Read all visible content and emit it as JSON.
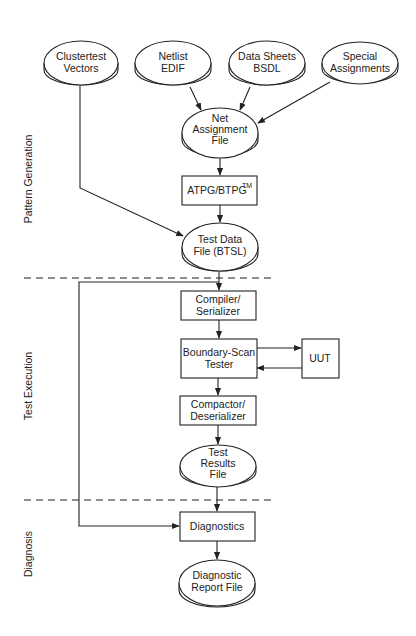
{
  "diagram": {
    "phases": [
      {
        "id": "pattern-generation",
        "label": "Pattern Generation"
      },
      {
        "id": "test-execution",
        "label": "Test Execution"
      },
      {
        "id": "diagnosis",
        "label": "Diagnosis"
      }
    ],
    "nodes": {
      "clustertest": {
        "type": "data-store",
        "lines": [
          "Clustertest",
          "Vectors"
        ]
      },
      "netlist": {
        "type": "data-store",
        "lines": [
          "Netlist",
          "EDIF"
        ]
      },
      "datasheets": {
        "type": "data-store",
        "lines": [
          "Data Sheets",
          "BSDL"
        ]
      },
      "special": {
        "type": "data-store",
        "lines": [
          "Special",
          "Assignments"
        ]
      },
      "netassign": {
        "type": "data-store",
        "lines": [
          "Net",
          "Assignment",
          "File"
        ]
      },
      "atpg": {
        "type": "process",
        "label": "ATPG/BTPG",
        "superscript": "TM"
      },
      "testdata": {
        "type": "data-store",
        "lines": [
          "Test Data",
          "File (BTSL)"
        ]
      },
      "compiler": {
        "type": "process",
        "lines": [
          "Compiler/",
          "Serializer"
        ]
      },
      "tester": {
        "type": "process",
        "lines": [
          "Boundary-Scan",
          "Tester"
        ]
      },
      "uut": {
        "type": "process",
        "label": "UUT"
      },
      "compactor": {
        "type": "process",
        "lines": [
          "Compactor/",
          "Deserializer"
        ]
      },
      "results": {
        "type": "data-store",
        "lines": [
          "Test",
          "Results",
          "File"
        ]
      },
      "diagnostics": {
        "type": "process",
        "label": "Diagnostics"
      },
      "report": {
        "type": "data-store",
        "lines": [
          "Diagnostic",
          "Report File"
        ]
      }
    },
    "edges": [
      {
        "from": "clustertest",
        "to": "testdata"
      },
      {
        "from": "netlist",
        "to": "netassign"
      },
      {
        "from": "datasheets",
        "to": "netassign"
      },
      {
        "from": "special",
        "to": "netassign"
      },
      {
        "from": "netassign",
        "to": "atpg"
      },
      {
        "from": "atpg",
        "to": "testdata"
      },
      {
        "from": "testdata",
        "to": "compiler"
      },
      {
        "from": "compiler",
        "to": "tester"
      },
      {
        "from": "tester",
        "to": "uut"
      },
      {
        "from": "uut",
        "to": "tester"
      },
      {
        "from": "tester",
        "to": "compactor"
      },
      {
        "from": "compactor",
        "to": "results"
      },
      {
        "from": "results",
        "to": "diagnostics"
      },
      {
        "from": "testdata",
        "to": "diagnostics"
      }
    ]
  }
}
